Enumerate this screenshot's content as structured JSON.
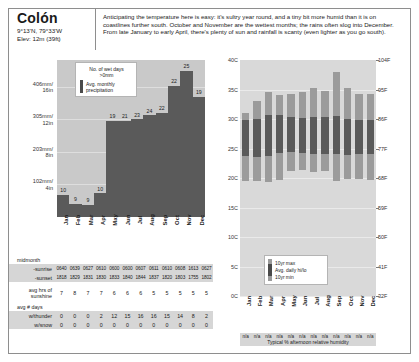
{
  "place": {
    "city": "Colón",
    "coords": "9°13'N, 79°33'W",
    "elevation": "Elev: 12m (39ft)"
  },
  "blurb": {
    "text": "Anticipating the temperature here is easy:  it's sultry year round, and a tiny bit more humid than it is on coastlines further south.  October and November are the wettest months; the rains often slog into December.  From late January to early April, there's plenty of sun and rainfall is scanty (even lighter as you go south)."
  },
  "months": [
    "Jan",
    "Feb",
    "Mar",
    "Apr",
    "May",
    "Jun",
    "Jul",
    "Aug",
    "Sep",
    "Oct",
    "Nov",
    "Dec"
  ],
  "precip_legend": {
    "wet_days": "No. of wet days",
    "wet_days_sub": ">0mm",
    "avg_precip_1": "Avg. monthly",
    "avg_precip_2": "precipitation"
  },
  "temp_legend": {
    "max": "10yr max",
    "avg": "Avg. daily hi/lo",
    "min": "10yr min"
  },
  "table": {
    "midmonth_label": "midmonth",
    "sunrise_label": "-sunrise",
    "sunset_label": "-sunset",
    "sunrise": [
      "0640",
      "0639",
      "0627",
      "0610",
      "0600",
      "0600",
      "0607",
      "0611",
      "0610",
      "0608",
      "1613",
      "0627"
    ],
    "sunset": [
      "1818",
      "1829",
      "1831",
      "1830",
      "1833",
      "1840",
      "1844",
      "1837",
      "1820",
      "1803",
      "1755",
      "1802"
    ],
    "sunshine_label_1": "avg hrs of",
    "sunshine_label_2": "sunshine",
    "sunshine": [
      7,
      8,
      7,
      7,
      6,
      6,
      6,
      5,
      5,
      5,
      5,
      5
    ],
    "days_label": "avg # days",
    "thunder_label": "w/thunder",
    "thunder": [
      0,
      0,
      0,
      2,
      12,
      15,
      16,
      16,
      15,
      14,
      8,
      2
    ],
    "snow_label": "w/snow",
    "snow": [
      0,
      0,
      0,
      0,
      0,
      0,
      0,
      0,
      0,
      0,
      0,
      0
    ]
  },
  "humidity": {
    "values": [
      "n/a",
      "n/a",
      "n/a",
      "n/a",
      "n/a",
      "n/a",
      "n/a",
      "n/a",
      "n/a",
      "n/a",
      "n/a",
      "n/a"
    ],
    "caption": "Typical % afternoon relative humidity"
  },
  "chart_data": [
    {
      "type": "bar",
      "title": "Avg. monthly precipitation & number of wet days",
      "categories": [
        "Jan",
        "Feb",
        "Mar",
        "Apr",
        "May",
        "Jun",
        "Jul",
        "Aug",
        "Sep",
        "Oct",
        "Nov",
        "Dec"
      ],
      "series": [
        {
          "name": "Avg. monthly precipitation (mm)",
          "units": "mm",
          "values": [
            70,
            41,
            38,
            74,
            300,
            300,
            305,
            318,
            325,
            410,
            457,
            376
          ]
        },
        {
          "name": "No. of wet days >0mm",
          "values": [
            10,
            9,
            9,
            10,
            19,
            21,
            23,
            24,
            22,
            22,
            25,
            19
          ]
        }
      ],
      "ylabel": "",
      "yticks_mm": [
        406,
        305,
        203,
        102
      ],
      "ytick_labels": [
        "406mm/\n16in",
        "305mm/\n12in",
        "203mm/\n8in",
        "102mm/\n4in"
      ],
      "ylim": [
        0,
        490
      ],
      "grid": true,
      "legend_position": "inside-top-left",
      "bar_value_labels": [
        10,
        9,
        9,
        10,
        19,
        21,
        23,
        24,
        22,
        22,
        25,
        19
      ]
    },
    {
      "type": "bar",
      "title": "Average daily high/low temperature with 10yr extremes",
      "categories": [
        "Jan",
        "Feb",
        "Mar",
        "Apr",
        "May",
        "Jun",
        "Jul",
        "Aug",
        "Sep",
        "Oct",
        "Nov",
        "Dec"
      ],
      "ylabel_left": "°C",
      "ylabel_right": "°F",
      "yticks_c": [
        40,
        35,
        30,
        25,
        20,
        15,
        10,
        5,
        0
      ],
      "ytick_labels_left": [
        "40C",
        "35C",
        "30C",
        "25C",
        "20C",
        "15C",
        "10C",
        "5C",
        "0C"
      ],
      "ytick_labels_right": [
        "104F",
        "95F",
        "86F",
        "77F",
        "68F",
        "59F",
        "50F",
        "41F",
        "32F"
      ],
      "ylim_c": [
        0,
        40
      ],
      "grid": true,
      "legend_position": "inside-bottom-center",
      "series": [
        {
          "name": "10yr max (C)",
          "values": [
            31.0,
            33.0,
            34.5,
            34.0,
            34.3,
            34.5,
            35.3,
            34.8,
            38.0,
            35.3,
            34.3,
            34.2
          ]
        },
        {
          "name": "Avg. daily high (C)",
          "values": [
            29.8,
            30.0,
            30.6,
            30.6,
            30.4,
            30.2,
            30.3,
            30.4,
            30.5,
            30.0,
            29.8,
            29.8
          ]
        },
        {
          "name": "Avg. daily low (C)",
          "values": [
            23.7,
            23.5,
            23.8,
            24.3,
            24.4,
            24.3,
            24.1,
            24.1,
            24.0,
            23.9,
            24.0,
            24.0
          ]
        },
        {
          "name": "10yr min (C)",
          "values": [
            19.5,
            19.5,
            19.3,
            19.6,
            21.2,
            21.4,
            21.0,
            21.2,
            19.5,
            19.8,
            19.8,
            19.6
          ]
        }
      ]
    }
  ]
}
